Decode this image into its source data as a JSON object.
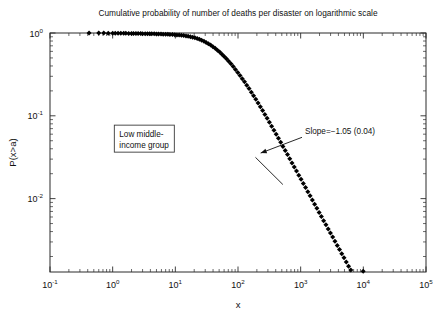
{
  "chart_data": {
    "type": "scatter",
    "title": "Cumulative probability of number of deaths per disaster on logarithmic scale",
    "xlabel": "x",
    "ylabel": "P(x>a)",
    "xscale": "log",
    "yscale": "log",
    "xlim": [
      0.1,
      100000
    ],
    "ylim": [
      0.0013,
      1.0
    ],
    "grid": false,
    "legend": null,
    "xtick_labels": [
      "10",
      "10",
      "10",
      "10",
      "10",
      "10",
      "10"
    ],
    "xtick_exponents": [
      "-1",
      "0",
      "1",
      "2",
      "3",
      "4",
      "5"
    ],
    "xtick_values": [
      0.1,
      1,
      10,
      100,
      1000,
      10000,
      100000
    ],
    "ytick_labels": [
      "10",
      "10",
      "10"
    ],
    "ytick_exponents": [
      "0",
      "-1",
      "-2"
    ],
    "ytick_values": [
      1,
      0.1,
      0.01
    ],
    "annotations": [
      {
        "name": "group-label",
        "text_line1": "Low middle-",
        "text_line2": "income group",
        "boxed": true,
        "x_data": 3.2,
        "y_data": 0.053
      },
      {
        "name": "slope-label",
        "text": "Slope=−1.05 (0.04)",
        "arrow_from_x": 1050,
        "arrow_from_y": 0.055,
        "arrow_to_x": 230,
        "arrow_to_y": 0.0355
      }
    ],
    "fit": {
      "slope": -1.05,
      "slope_error": 0.04,
      "segment_x": [
        190,
        520
      ],
      "segment_y": [
        0.0315,
        0.0148
      ]
    },
    "series": [
      {
        "name": "cumulative-probability",
        "marker": "diamond",
        "color": "#000000",
        "points": [
          [
            0.42,
            0.999
          ],
          [
            0.6,
            0.998
          ],
          [
            0.72,
            0.997
          ],
          [
            0.85,
            0.996
          ],
          [
            1.0,
            0.995
          ],
          [
            1.1,
            0.994
          ],
          [
            1.22,
            0.993
          ],
          [
            1.35,
            0.992
          ],
          [
            1.5,
            0.991
          ],
          [
            1.62,
            0.99
          ],
          [
            1.8,
            0.989
          ],
          [
            2.0,
            0.988
          ],
          [
            2.15,
            0.987
          ],
          [
            2.35,
            0.986
          ],
          [
            2.55,
            0.985
          ],
          [
            2.8,
            0.984
          ],
          [
            3.0,
            0.982
          ],
          [
            3.3,
            0.981
          ],
          [
            3.6,
            0.98
          ],
          [
            3.9,
            0.979
          ],
          [
            4.2,
            0.977
          ],
          [
            4.6,
            0.976
          ],
          [
            5.0,
            0.974
          ],
          [
            5.4,
            0.972
          ],
          [
            5.9,
            0.97
          ],
          [
            6.4,
            0.968
          ],
          [
            7.0,
            0.966
          ],
          [
            7.6,
            0.963
          ],
          [
            8.2,
            0.96
          ],
          [
            9.0,
            0.957
          ],
          [
            9.8,
            0.953
          ],
          [
            10.6,
            0.949
          ],
          [
            11.5,
            0.944
          ],
          [
            12.5,
            0.938
          ],
          [
            13.6,
            0.931
          ],
          [
            14.8,
            0.923
          ],
          [
            16.0,
            0.913
          ],
          [
            17.4,
            0.902
          ],
          [
            18.9,
            0.889
          ],
          [
            20.5,
            0.874
          ],
          [
            22.3,
            0.857
          ],
          [
            24.2,
            0.838
          ],
          [
            26.3,
            0.817
          ],
          [
            28.6,
            0.794
          ],
          [
            31.0,
            0.769
          ],
          [
            33.7,
            0.742
          ],
          [
            36.6,
            0.714
          ],
          [
            39.8,
            0.684
          ],
          [
            43.2,
            0.653
          ],
          [
            47.0,
            0.621
          ],
          [
            51.0,
            0.588
          ],
          [
            55.4,
            0.555
          ],
          [
            60.2,
            0.522
          ],
          [
            65.4,
            0.489
          ],
          [
            71.0,
            0.456
          ],
          [
            77.2,
            0.424
          ],
          [
            83.9,
            0.393
          ],
          [
            91.1,
            0.363
          ],
          [
            99.0,
            0.334
          ],
          [
            107.6,
            0.307
          ],
          [
            116.9,
            0.281
          ],
          [
            127.0,
            0.257
          ],
          [
            138.0,
            0.234
          ],
          [
            150.0,
            0.213
          ],
          [
            163.0,
            0.193
          ],
          [
            177.1,
            0.175
          ],
          [
            192.5,
            0.158
          ],
          [
            209.2,
            0.143
          ],
          [
            227.3,
            0.129
          ],
          [
            247.0,
            0.116
          ],
          [
            268.4,
            0.104
          ],
          [
            291.6,
            0.0935
          ],
          [
            316.9,
            0.0838
          ],
          [
            344.3,
            0.075
          ],
          [
            374.2,
            0.0671
          ],
          [
            406.6,
            0.06
          ],
          [
            441.8,
            0.0536
          ],
          [
            480.1,
            0.0479
          ],
          [
            521.7,
            0.0427
          ],
          [
            566.9,
            0.0381
          ],
          [
            616.0,
            0.034
          ],
          [
            669.3,
            0.0303
          ],
          [
            727.3,
            0.027
          ],
          [
            790.3,
            0.0241
          ],
          [
            858.8,
            0.0215
          ],
          [
            933.2,
            0.0192
          ],
          [
            1014,
            0.0171
          ],
          [
            1102,
            0.0152
          ],
          [
            1197,
            0.0136
          ],
          [
            1301,
            0.0121
          ],
          [
            1414,
            0.0108
          ],
          [
            1536,
            0.00962
          ],
          [
            1669,
            0.00858
          ],
          [
            1814,
            0.00765
          ],
          [
            1971,
            0.00682
          ],
          [
            2142,
            0.00608
          ],
          [
            2327,
            0.00542
          ],
          [
            2529,
            0.00483
          ],
          [
            2748,
            0.00431
          ],
          [
            2986,
            0.00384
          ],
          [
            3245,
            0.00343
          ],
          [
            3526,
            0.00305
          ],
          [
            3832,
            0.00272
          ],
          [
            4164,
            0.00243
          ],
          [
            4525,
            0.00216
          ],
          [
            4917,
            0.00193
          ],
          [
            5343,
            0.00172
          ],
          [
            5806,
            0.00153
          ],
          [
            6309,
            0.00137
          ],
          [
            9950,
            0.00133
          ]
        ]
      }
    ]
  }
}
